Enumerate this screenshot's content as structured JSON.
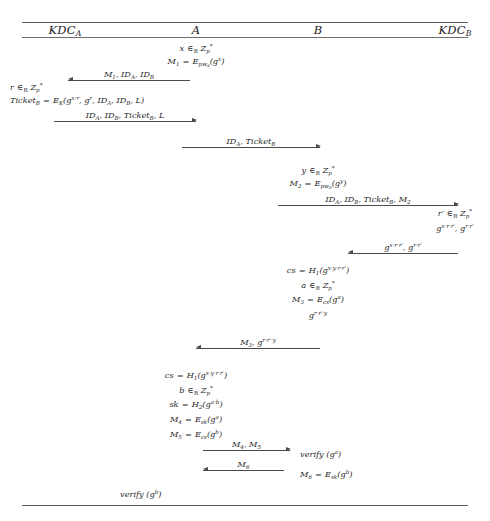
{
  "diagram": {
    "actors": [
      {
        "id": "kdca",
        "label": "KDCₐ",
        "label_plain": "KDC_A",
        "x": 65
      },
      {
        "id": "a",
        "label": "A",
        "label_plain": "A",
        "x": 196
      },
      {
        "id": "b",
        "label": "B",
        "label_plain": "B",
        "x": 318
      },
      {
        "id": "kdcb",
        "label": "KDC_B",
        "label_plain": "KDC_B",
        "x": 455
      }
    ],
    "rules": [
      {
        "name": "top-rule",
        "y": 22
      },
      {
        "name": "header-rule",
        "y": 37
      },
      {
        "name": "bottom-rule",
        "y": 505
      }
    ],
    "notes": [
      {
        "id": "n1",
        "text": "x ∈_R Z*_p",
        "x": 196,
        "y": 44,
        "align": "center",
        "actor": "a"
      },
      {
        "id": "n2",
        "text": "M_1 = E_{pw_A}(g^x)",
        "x": 196,
        "y": 57,
        "align": "center",
        "actor": "a"
      },
      {
        "id": "n3",
        "text": "r ∈_R Z*_p",
        "x": 10,
        "y": 83,
        "align": "left",
        "actor": "kdca"
      },
      {
        "id": "n4",
        "text": "Ticket_B = E_K(g^{x·r}, g^r, ID_A, ID_B, L)",
        "x": 10,
        "y": 96,
        "align": "left",
        "actor": "kdca"
      },
      {
        "id": "n5",
        "text": "y ∈_R Z*_p",
        "x": 318,
        "y": 166,
        "align": "center",
        "actor": "b"
      },
      {
        "id": "n6",
        "text": "M_2 = E_{pw_B}(g^y)",
        "x": 318,
        "y": 179,
        "align": "center",
        "actor": "b"
      },
      {
        "id": "n7",
        "text": "r' ∈_R Z*_p",
        "x": 455,
        "y": 209,
        "align": "center",
        "actor": "kdcb"
      },
      {
        "id": "n8",
        "text": "g^{x·r·r'}, g^{r·r'}",
        "x": 455,
        "y": 224,
        "align": "center",
        "actor": "kdcb"
      },
      {
        "id": "n9",
        "text": "cs = H_1(g^{x·y·r·r'})",
        "x": 318,
        "y": 266,
        "align": "center",
        "actor": "b"
      },
      {
        "id": "n10",
        "text": "a ∈_R Z*_p",
        "x": 318,
        "y": 281,
        "align": "center",
        "actor": "b"
      },
      {
        "id": "n11",
        "text": "M_3 = E_cs(g^a)",
        "x": 318,
        "y": 295,
        "align": "center",
        "actor": "b"
      },
      {
        "id": "n12",
        "text": "g^{r·r'·y}",
        "x": 318,
        "y": 311,
        "align": "center",
        "actor": "b"
      },
      {
        "id": "n13",
        "text": "cs = H_1(g^{x·y·r·r'})",
        "x": 196,
        "y": 371,
        "align": "center",
        "actor": "a"
      },
      {
        "id": "n14",
        "text": "b ∈_R Z*_p",
        "x": 196,
        "y": 386,
        "align": "center",
        "actor": "a"
      },
      {
        "id": "n15",
        "text": "sk = H_2(g^{a·b})",
        "x": 196,
        "y": 400,
        "align": "center",
        "actor": "a"
      },
      {
        "id": "n16",
        "text": "M_4 = E_sk(g^a)",
        "x": 196,
        "y": 415,
        "align": "center",
        "actor": "a"
      },
      {
        "id": "n17",
        "text": "M_5 = E_cs(g^b)",
        "x": 196,
        "y": 430,
        "align": "center",
        "actor": "a"
      },
      {
        "id": "n18",
        "text": "verify (g^a)",
        "x": 318,
        "y": 450,
        "align": "center",
        "actor": "b"
      },
      {
        "id": "n19",
        "text": "M_6 = E_sk(g^b)",
        "x": 318,
        "y": 470,
        "align": "center",
        "actor": "b"
      },
      {
        "id": "n20",
        "text": "verify (g^b)",
        "x": 196,
        "y": 490,
        "align": "center",
        "actor": "a"
      }
    ],
    "messages": [
      {
        "id": "m1",
        "label": "M_1, ID_A, ID_B",
        "from": "A",
        "to": "KDC_A",
        "direction": "to-left",
        "x1": 68,
        "x2": 190,
        "y": 80
      },
      {
        "id": "m2",
        "label": "ID_A, ID_B, Ticket_B, L",
        "from": "KDC_A",
        "to": "A",
        "direction": "to-right",
        "x1": 54,
        "x2": 196,
        "y": 121
      },
      {
        "id": "m3",
        "label": "ID_A, Ticket_B",
        "from": "A",
        "to": "B",
        "direction": "to-right",
        "x1": 182,
        "x2": 320,
        "y": 147
      },
      {
        "id": "m4",
        "label": "ID_A, ID_B, Ticket_B, M_2",
        "from": "B",
        "to": "KDC_B",
        "direction": "to-right",
        "x1": 278,
        "x2": 458,
        "y": 205
      },
      {
        "id": "m5",
        "label": "g^{x·r·r'}, g^{r·r'}",
        "from": "KDC_B",
        "to": "B",
        "direction": "to-left",
        "x1": 348,
        "x2": 458,
        "y": 253
      },
      {
        "id": "m6",
        "label": "M_3, g^{r·r'·y}",
        "from": "B",
        "to": "A",
        "direction": "to-left",
        "x1": 196,
        "x2": 320,
        "y": 348
      },
      {
        "id": "m7",
        "label": "M_4, M_5",
        "from": "A",
        "to": "B",
        "direction": "to-right",
        "x1": 203,
        "x2": 290,
        "y": 450
      },
      {
        "id": "m8",
        "label": "M_6",
        "from": "B",
        "to": "A",
        "direction": "to-left",
        "x1": 203,
        "x2": 284,
        "y": 470
      }
    ]
  }
}
